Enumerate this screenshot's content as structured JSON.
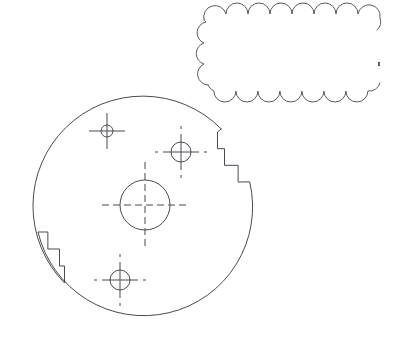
{
  "document": {
    "type": "cad-line-drawing",
    "title": "Circular flange plate with revision cloud",
    "background_color": "#ffffff",
    "line_color": "#4a4a52",
    "cloud_line_color": "#5a5a62",
    "canvas": {
      "width": 399,
      "height": 343
    }
  },
  "geometry": {
    "plate": {
      "name": "flange-plate-outline",
      "shape": "circle-with-two-notches",
      "center": {
        "x": 145,
        "y": 204
      },
      "radius": 107,
      "notches": [
        {
          "name": "notch-right",
          "position": "upper-right",
          "style": "stepped-cut",
          "start": {
            "x": 218,
            "y": 132
          },
          "end": {
            "x": 249,
            "y": 182
          },
          "steps": 3
        },
        {
          "name": "notch-left",
          "position": "lower-left",
          "style": "stepped-cut",
          "start": {
            "x": 38,
            "y": 232
          },
          "end": {
            "x": 63,
            "y": 283
          },
          "steps": 3
        }
      ]
    },
    "center_bore": {
      "name": "center-bore",
      "center": {
        "x": 145,
        "y": 205
      },
      "radius": 25,
      "centerline_style": "dashed",
      "centerline_extension": 18
    },
    "holes": [
      {
        "name": "hole-upper-left",
        "center": {
          "x": 107,
          "y": 131
        },
        "radius": 6,
        "marker": "crosshair",
        "crosshair_length": 12,
        "outer_ticks": false
      },
      {
        "name": "hole-upper-right",
        "center": {
          "x": 181,
          "y": 152
        },
        "radius": 10,
        "marker": "crosshair",
        "crosshair_length": 8,
        "outer_ticks": true
      },
      {
        "name": "hole-bottom",
        "center": {
          "x": 120,
          "y": 280
        },
        "radius": 10,
        "marker": "crosshair",
        "crosshair_length": 8,
        "outer_ticks": true
      }
    ],
    "revision_cloud": {
      "name": "revision-cloud",
      "bounds": {
        "x": 204,
        "y": 14,
        "width": 176,
        "height": 77
      },
      "arc_radius": 11,
      "open_side": "right",
      "detached_tick": {
        "x": 378,
        "y": 62
      },
      "arcs_top": 8,
      "arcs_bottom": 8,
      "arcs_left": 3
    }
  },
  "chart_data": {
    "type": "table",
    "categories": [
      "plate-outline",
      "center-bore",
      "hole-upper-left",
      "hole-upper-right",
      "hole-bottom",
      "revision-cloud"
    ],
    "values": [
      107,
      25,
      6,
      10,
      10,
      0
    ]
  }
}
